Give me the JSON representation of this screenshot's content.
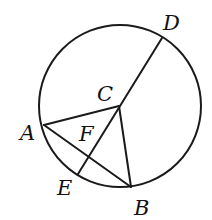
{
  "figure": {
    "type": "geometry",
    "stroke_color": "#1a1a1a",
    "background": "#ffffff",
    "circle": {
      "cx": 120,
      "cy": 106,
      "r": 81
    },
    "points": {
      "A": {
        "x": 44,
        "y": 125
      },
      "B": {
        "x": 131,
        "y": 187
      },
      "C": {
        "x": 119,
        "y": 106
      },
      "D": {
        "x": 162,
        "y": 38
      },
      "E": {
        "x": 78,
        "y": 174
      },
      "F": {
        "x": 89,
        "y": 156
      }
    },
    "segments": [
      {
        "from": "D",
        "to": "E"
      },
      {
        "from": "C",
        "to": "A"
      },
      {
        "from": "C",
        "to": "B"
      },
      {
        "from": "A",
        "to": "B"
      }
    ],
    "labels": [
      {
        "text": "D",
        "x": 163,
        "y": 30
      },
      {
        "text": "C",
        "x": 97,
        "y": 101
      },
      {
        "text": "A",
        "x": 20,
        "y": 140
      },
      {
        "text": "F",
        "x": 79,
        "y": 141
      },
      {
        "text": "E",
        "x": 57,
        "y": 195
      },
      {
        "text": "B",
        "x": 134,
        "y": 215
      }
    ]
  }
}
